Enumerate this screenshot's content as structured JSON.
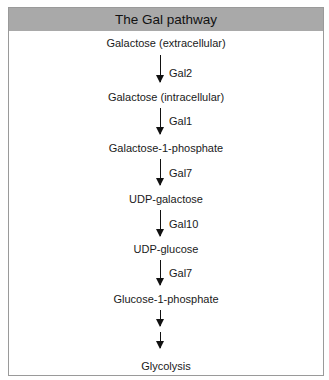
{
  "title": "The Gal pathway",
  "steps": [
    {
      "metabolite": "Galactose (extracellular)",
      "enzyme": "Gal2"
    },
    {
      "metabolite": "Galactose (intracellular)",
      "enzyme": "Gal1"
    },
    {
      "metabolite": "Galactose-1-phosphate",
      "enzyme": "Gal7"
    },
    {
      "metabolite": "UDP-galactose",
      "enzyme": "Gal10"
    },
    {
      "metabolite": "UDP-glucose",
      "enzyme": "Gal7"
    },
    {
      "metabolite": "Glucose-1-phosphate",
      "enzyme": ""
    },
    {
      "metabolite": "Glycolysis",
      "enzyme": ""
    }
  ],
  "colors": {
    "header_bg": "#a9a9a9",
    "border": "#9a9a9a",
    "text": "#1a1a1a"
  }
}
